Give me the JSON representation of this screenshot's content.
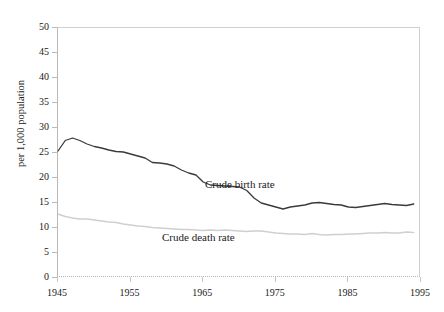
{
  "figure": {
    "background": "#ffffff",
    "ylabel": "per 1,000 population",
    "annotations": {
      "birth": "Crude birth rate",
      "death": "Crude death rate"
    }
  },
  "chart_data": {
    "type": "line",
    "title": "",
    "xlabel": "",
    "ylabel": "per 1,000 population",
    "xlim": [
      1945,
      1995
    ],
    "ylim": [
      0,
      50
    ],
    "xticks": [
      1945,
      1955,
      1965,
      1975,
      1985,
      1995
    ],
    "yticks": [
      0,
      5,
      10,
      15,
      20,
      25,
      30,
      35,
      40,
      45,
      50
    ],
    "grid": false,
    "legend_position": "inline-annotation",
    "x": [
      1945,
      1946,
      1947,
      1948,
      1949,
      1950,
      1951,
      1952,
      1953,
      1954,
      1955,
      1956,
      1957,
      1958,
      1959,
      1960,
      1961,
      1962,
      1963,
      1964,
      1965,
      1966,
      1967,
      1968,
      1969,
      1970,
      1971,
      1972,
      1973,
      1974,
      1975,
      1976,
      1977,
      1978,
      1979,
      1980,
      1981,
      1982,
      1983,
      1984,
      1985,
      1986,
      1987,
      1988,
      1989,
      1990,
      1991,
      1992,
      1993,
      1994
    ],
    "series": [
      {
        "name": "Crude birth rate",
        "color": "#3a3a3a",
        "values": [
          25.4,
          27.5,
          28.0,
          27.5,
          26.8,
          26.3,
          26.0,
          25.6,
          25.3,
          25.2,
          24.8,
          24.4,
          24.0,
          23.1,
          23.0,
          22.8,
          22.4,
          21.6,
          21.0,
          20.6,
          19.2,
          18.6,
          18.5,
          18.4,
          18.3,
          18.2,
          17.5,
          16.0,
          15.0,
          14.6,
          14.2,
          13.8,
          14.2,
          14.4,
          14.6,
          15.0,
          15.1,
          14.9,
          14.7,
          14.6,
          14.2,
          14.1,
          14.3,
          14.5,
          14.7,
          14.9,
          14.7,
          14.6,
          14.5,
          14.8
        ]
      },
      {
        "name": "Crude death rate",
        "color": "#cfcfcf",
        "values": [
          12.8,
          12.3,
          12.0,
          11.8,
          11.8,
          11.6,
          11.4,
          11.2,
          11.1,
          10.8,
          10.6,
          10.4,
          10.3,
          10.1,
          10.0,
          9.9,
          9.8,
          9.7,
          9.7,
          9.6,
          9.5,
          9.6,
          9.5,
          9.6,
          9.5,
          9.4,
          9.3,
          9.4,
          9.4,
          9.2,
          9.0,
          8.9,
          8.8,
          8.8,
          8.7,
          8.9,
          8.7,
          8.6,
          8.7,
          8.7,
          8.8,
          8.8,
          8.9,
          9.0,
          9.0,
          9.1,
          9.0,
          9.0,
          9.2,
          9.1
        ]
      }
    ]
  }
}
